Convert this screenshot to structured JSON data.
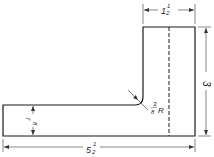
{
  "drawing": {
    "type": "orthographic-view",
    "shape": "L-bracket",
    "colors": {
      "line": "#1a1a1a",
      "dim": "#333333",
      "background": "#ffffff"
    },
    "dimensions": {
      "top_width": {
        "whole": "1",
        "num": "1",
        "den": "2",
        "value": "1 1/2"
      },
      "height": {
        "whole": "3",
        "value": "3"
      },
      "overall_length": {
        "whole": "5",
        "num": "1",
        "den": "2",
        "value": "5 1/2"
      },
      "arm_thickness": {
        "num": "7",
        "den": "8",
        "value": "7/8"
      },
      "fillet_radius": {
        "num": "3",
        "den": "8",
        "suffix": "R",
        "value": "3/8 R"
      }
    }
  }
}
